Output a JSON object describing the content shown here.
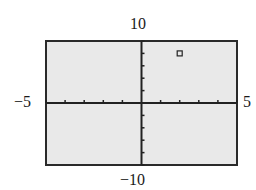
{
  "chart_data": {
    "type": "scatter",
    "title": "",
    "xlabel": "",
    "ylabel": "",
    "xlim": [
      -5,
      5
    ],
    "ylim": [
      -10,
      10
    ],
    "xscale": 1,
    "yscale": 2,
    "grid": false,
    "tick_labels": {
      "xmin": "−5",
      "xmax": "5",
      "ymin": "−10",
      "ymax": "10"
    },
    "points": [
      {
        "x": 2,
        "y": 8,
        "marker": "square"
      }
    ]
  }
}
